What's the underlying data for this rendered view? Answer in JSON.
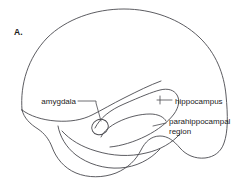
{
  "figure": {
    "panel_letter": "A.",
    "background_color": "#ffffff",
    "line_color": "#4a4a4f",
    "text_color": "#1b1b1b"
  },
  "labels": {
    "amygdala": "amygdala",
    "hippocampus": "hippocampus",
    "parahippocampal_line1": "parahippocampal",
    "parahippocampal_line2": "region"
  },
  "structures": [
    {
      "name": "amygdala",
      "label": "amygdala",
      "label_side": "left"
    },
    {
      "name": "hippocampus",
      "label": "hippocampus",
      "label_side": "right"
    },
    {
      "name": "parahippocampal-region",
      "label": "parahippocampal region",
      "label_side": "right"
    }
  ]
}
